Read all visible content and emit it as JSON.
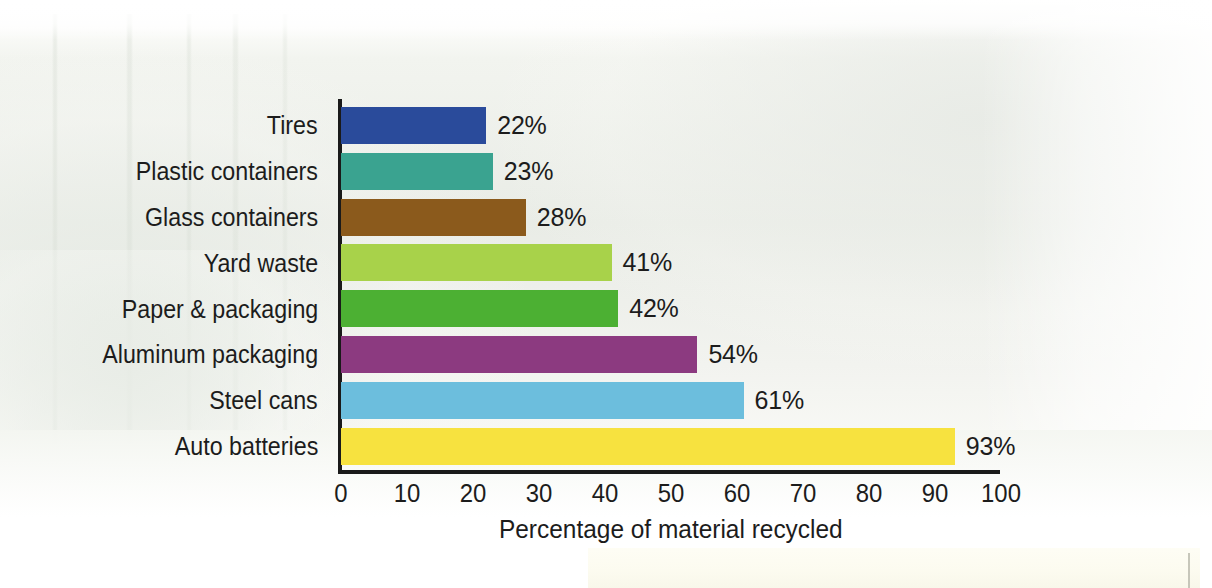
{
  "chart_data": {
    "type": "bar",
    "orientation": "horizontal",
    "title": "",
    "xlabel": "Percentage of material recycled",
    "ylabel": "",
    "xlim": [
      0,
      100
    ],
    "xticks": [
      0,
      10,
      20,
      30,
      40,
      50,
      60,
      70,
      80,
      90,
      100
    ],
    "grid": false,
    "legend": "none",
    "categories": [
      "Tires",
      "Plastic containers",
      "Glass containers",
      "Yard waste",
      "Paper & packaging",
      "Aluminum packaging",
      "Steel cans",
      "Auto batteries"
    ],
    "values": [
      22,
      23,
      28,
      41,
      42,
      54,
      61,
      93
    ],
    "value_labels": [
      "22%",
      "23%",
      "28%",
      "41%",
      "42%",
      "54%",
      "61%",
      "93%"
    ],
    "bar_colors": [
      "#2a4b9b",
      "#3aa390",
      "#8b5a1c",
      "#a8d24a",
      "#4cb033",
      "#8c3a80",
      "#6cbedd",
      "#f7e23f"
    ],
    "axis_color": "#1a1a1a",
    "text_color": "#1c1c1c",
    "background": "#eceee8"
  }
}
